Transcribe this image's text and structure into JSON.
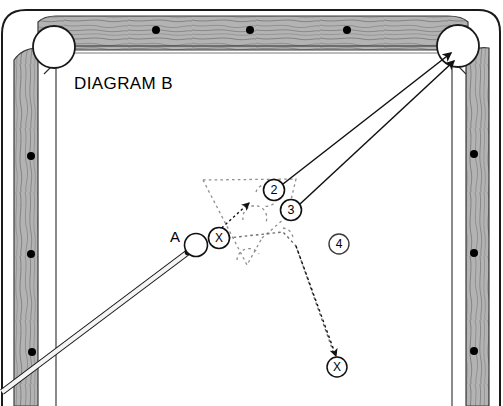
{
  "diagram": {
    "title": "DIAGRAM B",
    "type": "billiards-shot-diagram",
    "cue_ball_label": "A",
    "canvas": {
      "width": 503,
      "height": 406
    }
  },
  "colors": {
    "cloth": "#ffffff",
    "rail_wood": "#b0b0b0",
    "rail_grain": "#5a5a5a",
    "outline": "#1a1a1a",
    "pocket_fill": "#ffffff",
    "cue_stick": "#f2f2f2",
    "dotted_ghost": "#8c8c8c",
    "ball_outline": "#000000",
    "cue_ball_fill": "#ffffff"
  },
  "table": {
    "rails": [
      {
        "name": "top-rail",
        "diamond_count": 3
      },
      {
        "name": "left-rail",
        "diamond_count": 3
      },
      {
        "name": "right-rail",
        "diamond_count": 3
      }
    ],
    "pockets": [
      {
        "name": "top-left-pocket",
        "cx": 54,
        "cy": 47,
        "r": 20
      },
      {
        "name": "top-right-pocket",
        "cx": 458,
        "cy": 46,
        "r": 20
      }
    ]
  },
  "balls": [
    {
      "name": "cue-ball",
      "label": "",
      "cx": 196,
      "cy": 245,
      "r": 11,
      "style": "cue"
    },
    {
      "name": "ball-x-contact",
      "label": "X",
      "cx": 219,
      "cy": 238,
      "r": 10,
      "style": "marked"
    },
    {
      "name": "ball-2",
      "label": "2",
      "cx": 274,
      "cy": 190,
      "r": 10,
      "style": "numbered"
    },
    {
      "name": "ball-3",
      "label": "3",
      "cx": 291,
      "cy": 210,
      "r": 10,
      "style": "numbered"
    },
    {
      "name": "ball-4",
      "label": "4",
      "cx": 339,
      "cy": 244,
      "r": 10,
      "style": "numbered"
    },
    {
      "name": "ball-x-destination",
      "label": "X",
      "cx": 337,
      "cy": 367,
      "r": 10,
      "style": "marked"
    }
  ],
  "shot_lines": [
    {
      "name": "cue-stick-line",
      "kind": "cue-stick",
      "from": [
        2,
        391
      ],
      "to": [
        188,
        252
      ]
    },
    {
      "name": "trajectory-ball-2-to-pocket",
      "kind": "solid-arrow",
      "from": [
        283,
        184
      ],
      "to": [
        450,
        54
      ]
    },
    {
      "name": "trajectory-ball-3-to-pocket",
      "kind": "solid-arrow",
      "from": [
        299,
        205
      ],
      "to": [
        452,
        61
      ]
    },
    {
      "name": "contact-double-arrow",
      "kind": "dotted-double-arrow",
      "from": [
        215,
        234
      ],
      "to": [
        247,
        205
      ]
    },
    {
      "name": "trajectory-x-to-destination",
      "kind": "dotted-arrow",
      "from": [
        226,
        235
      ],
      "to": [
        334,
        356
      ]
    }
  ],
  "cluster": {
    "name": "ghost-rack-outline",
    "style": "dotted",
    "description": "dotted triangular rack outline with ghost ball outlines"
  }
}
